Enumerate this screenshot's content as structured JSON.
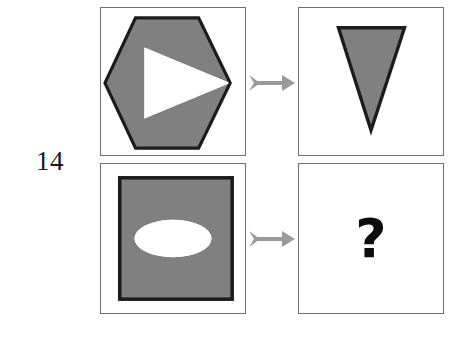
{
  "page": {
    "background_color": "#ffffff",
    "width": 466,
    "height": 340
  },
  "item": {
    "number_label": "14"
  },
  "colors": {
    "shape_fill": "#808080",
    "shape_outline": "#1c1c1c",
    "panel_border": "#6f6f6f",
    "arrow": "#9a9a9a",
    "cutout": "#ffffff",
    "question_mark": "#0c0c0c"
  },
  "panels": {
    "top_left": {
      "name": "hexagon-with-triangle-cutout",
      "outer_shape": "hexagon",
      "outer_fill": "#808080",
      "outer_outline": "#1c1c1c",
      "inner_shape": "triangle",
      "inner_fill": "#ffffff",
      "inner_direction": "right",
      "description": "Gray hexagon with a white right-pointing triangle removed from its interior"
    },
    "top_right": {
      "name": "downward-triangle",
      "outer_shape": "triangle",
      "outer_fill": "#808080",
      "outer_outline": "#1c1c1c",
      "inner_shape": "none",
      "inner_direction": "down",
      "description": "Gray downward-pointing triangle with dark outline"
    },
    "bottom_left": {
      "name": "square-with-ellipse-cutout",
      "outer_shape": "square",
      "outer_fill": "#808080",
      "outer_outline": "#1c1c1c",
      "inner_shape": "ellipse",
      "inner_fill": "#ffffff",
      "inner_direction": "horizontal",
      "description": "Gray square with a white horizontal ellipse removed from its interior"
    },
    "bottom_right": {
      "name": "answer-placeholder",
      "outer_shape": "none",
      "content": "?",
      "description": "Empty answer panel containing a bold question mark"
    }
  },
  "arrows": {
    "top": {
      "label": "transforms-into",
      "direction": "right",
      "color": "#9a9a9a"
    },
    "bottom": {
      "label": "transforms-into",
      "direction": "right",
      "color": "#9a9a9a"
    }
  }
}
